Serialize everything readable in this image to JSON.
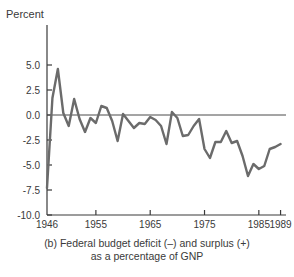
{
  "figure": {
    "ylabel": "Percent",
    "caption_line1": "(b) Federal budget deficit (–) and surplus (+)",
    "caption_line2": "as a percentage of GNP"
  },
  "axis": {
    "y_ticks": [
      "5.0",
      "2.5",
      "0.0",
      "-2.5",
      "-5.0",
      "-7.5",
      "-10.0"
    ],
    "x_ticks": [
      "1946",
      "1955",
      "1965",
      "1975",
      "1985",
      "1989"
    ]
  },
  "colors": {
    "line": "#6b6b6b",
    "axis": "#3a3a3a",
    "text": "#3a3a3a",
    "background": "#ffffff"
  },
  "chart_data": {
    "type": "line",
    "title": "(b) Federal budget deficit (–) and surplus (+) as a percentage of GNP",
    "xlabel": "",
    "ylabel": "Percent",
    "xlim": [
      1946,
      1990
    ],
    "ylim": [
      -10.0,
      6.2
    ],
    "grid": false,
    "legend": null,
    "y_ticks": [
      5.0,
      2.5,
      0.0,
      -2.5,
      -5.0,
      -7.5,
      -10.0
    ],
    "x_ticks": [
      1946,
      1955,
      1965,
      1975,
      1985,
      1989
    ],
    "zero_line": 0.0,
    "series": [
      {
        "name": "Federal budget surplus/deficit as % of GNP",
        "x": [
          1946,
          1947,
          1948,
          1949,
          1950,
          1951,
          1952,
          1953,
          1954,
          1955,
          1956,
          1957,
          1958,
          1959,
          1960,
          1961,
          1962,
          1963,
          1964,
          1965,
          1966,
          1967,
          1968,
          1969,
          1970,
          1971,
          1972,
          1973,
          1974,
          1975,
          1976,
          1977,
          1978,
          1979,
          1980,
          1981,
          1982,
          1983,
          1984,
          1985,
          1986,
          1987,
          1988,
          1989
        ],
        "values": [
          -7.3,
          1.7,
          4.6,
          0.2,
          -1.1,
          1.6,
          -0.4,
          -1.7,
          -0.3,
          -0.8,
          0.9,
          0.7,
          -0.6,
          -2.6,
          0.1,
          -0.6,
          -1.3,
          -0.8,
          -0.9,
          -0.2,
          -0.5,
          -1.1,
          -2.9,
          0.3,
          -0.3,
          -2.1,
          -2.0,
          -1.1,
          -0.4,
          -3.4,
          -4.3,
          -2.7,
          -2.7,
          -1.6,
          -2.8,
          -2.6,
          -4.1,
          -6.1,
          -4.9,
          -5.4,
          -5.1,
          -3.4,
          -3.2,
          -2.9
        ]
      }
    ]
  }
}
